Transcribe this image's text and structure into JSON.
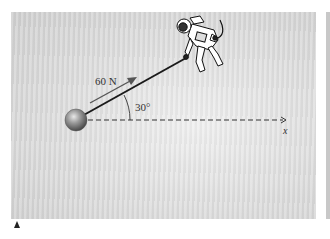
{
  "figure": {
    "force_label": "60 N",
    "angle_label": "30°",
    "axis_label": "x",
    "colors": {
      "background": "#dcdcdc",
      "rope": "#1a1a1a",
      "force_arrow": "#555555",
      "ball": "#8a8a8a",
      "axis": "#333333"
    },
    "elements": {
      "ball": "sphere",
      "rope": "line-from-ball-to-astronaut",
      "astronaut": "astronaut-icon",
      "force_vector": "arrow-up-right",
      "axis": "dashed-x-axis",
      "angle_arc": "arc-between-rope-and-axis"
    }
  }
}
